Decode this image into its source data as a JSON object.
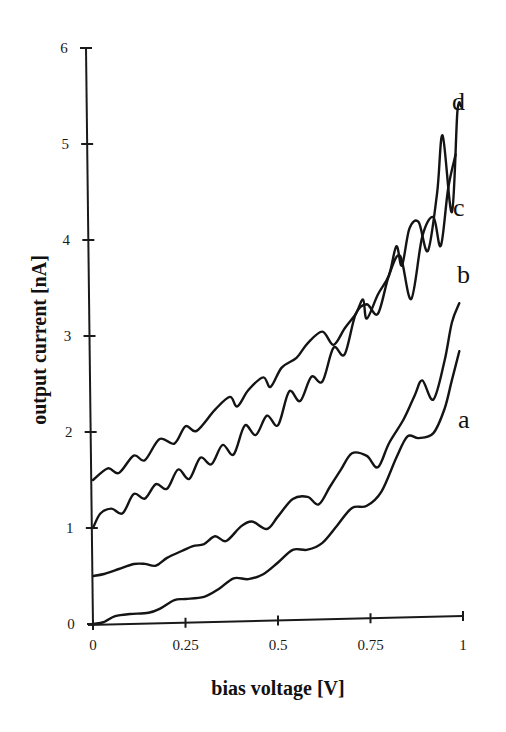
{
  "chart_data": {
    "type": "line",
    "title": "",
    "xlabel": "bias voltage [V]",
    "ylabel": "output current [nA]",
    "xlim": [
      0,
      1
    ],
    "ylim": [
      0,
      6
    ],
    "grid": false,
    "legend": "inline labels at right end of each curve",
    "x_ticks": [
      0,
      0.25,
      0.5,
      0.75,
      1
    ],
    "x_tick_labels": [
      "0",
      "0.25",
      "0.5",
      "0.75",
      "1"
    ],
    "y_ticks": [
      0,
      1,
      2,
      3,
      4,
      5,
      6
    ],
    "y_tick_labels": [
      "0",
      "1",
      "2",
      "3",
      "4",
      "5",
      "6"
    ],
    "series": [
      {
        "name": "a",
        "x": [
          0,
          0.03,
          0.06,
          0.1,
          0.15,
          0.18,
          0.22,
          0.25,
          0.3,
          0.34,
          0.38,
          0.42,
          0.46,
          0.5,
          0.54,
          0.58,
          0.62,
          0.66,
          0.7,
          0.74,
          0.78,
          0.82,
          0.85,
          0.88,
          0.92,
          0.95,
          0.97,
          0.99
        ],
        "values": [
          0,
          0.02,
          0.08,
          0.1,
          0.11,
          0.15,
          0.24,
          0.25,
          0.27,
          0.35,
          0.46,
          0.45,
          0.5,
          0.62,
          0.75,
          0.75,
          0.82,
          1.0,
          1.18,
          1.2,
          1.35,
          1.7,
          1.92,
          1.9,
          1.95,
          2.2,
          2.5,
          2.8
        ]
      },
      {
        "name": "b",
        "x": [
          0,
          0.03,
          0.07,
          0.11,
          0.14,
          0.17,
          0.2,
          0.24,
          0.27,
          0.3,
          0.33,
          0.36,
          0.4,
          0.43,
          0.47,
          0.5,
          0.54,
          0.58,
          0.61,
          0.64,
          0.67,
          0.7,
          0.74,
          0.77,
          0.8,
          0.84,
          0.87,
          0.89,
          0.92,
          0.95,
          0.97,
          0.99
        ],
        "values": [
          0.5,
          0.52,
          0.57,
          0.62,
          0.62,
          0.6,
          0.68,
          0.75,
          0.8,
          0.82,
          0.9,
          0.85,
          1.0,
          1.05,
          0.97,
          1.1,
          1.28,
          1.3,
          1.22,
          1.4,
          1.58,
          1.75,
          1.72,
          1.6,
          1.85,
          2.1,
          2.35,
          2.5,
          2.3,
          2.7,
          3.1,
          3.3
        ]
      },
      {
        "name": "c",
        "x": [
          0,
          0.02,
          0.05,
          0.08,
          0.11,
          0.14,
          0.17,
          0.2,
          0.23,
          0.26,
          0.29,
          0.32,
          0.35,
          0.38,
          0.41,
          0.44,
          0.47,
          0.5,
          0.53,
          0.56,
          0.59,
          0.62,
          0.65,
          0.68,
          0.71,
          0.74,
          0.77,
          0.8,
          0.83,
          0.86,
          0.89,
          0.92,
          0.94,
          0.96,
          0.98
        ],
        "values": [
          1.0,
          1.15,
          1.2,
          1.15,
          1.35,
          1.3,
          1.45,
          1.4,
          1.6,
          1.5,
          1.72,
          1.65,
          1.85,
          1.75,
          2.05,
          1.95,
          2.15,
          2.05,
          2.4,
          2.3,
          2.55,
          2.5,
          2.85,
          2.78,
          3.2,
          3.3,
          3.2,
          3.6,
          3.8,
          3.35,
          4.0,
          4.2,
          3.9,
          4.5,
          4.85
        ]
      },
      {
        "name": "d",
        "x": [
          0,
          0.04,
          0.07,
          0.11,
          0.14,
          0.18,
          0.22,
          0.25,
          0.28,
          0.33,
          0.37,
          0.39,
          0.42,
          0.46,
          0.48,
          0.51,
          0.55,
          0.58,
          0.62,
          0.65,
          0.68,
          0.71,
          0.73,
          0.74,
          0.77,
          0.8,
          0.82,
          0.835,
          0.855,
          0.88,
          0.905,
          0.93,
          0.945,
          0.97,
          0.985,
          0.995
        ],
        "values": [
          1.5,
          1.62,
          1.57,
          1.75,
          1.7,
          1.92,
          1.87,
          2.05,
          2.0,
          2.22,
          2.35,
          2.25,
          2.42,
          2.55,
          2.45,
          2.65,
          2.75,
          2.9,
          3.02,
          2.88,
          3.05,
          3.2,
          3.35,
          3.15,
          3.4,
          3.6,
          3.9,
          3.7,
          4.08,
          4.15,
          3.85,
          4.45,
          5.05,
          4.25,
          5.3,
          5.35
        ]
      }
    ]
  },
  "axes": {
    "x_title": "bias voltage [V]",
    "y_title": "output current [nA]"
  },
  "labels": {
    "a": "a",
    "b": "b",
    "c": "c",
    "d": "d"
  }
}
